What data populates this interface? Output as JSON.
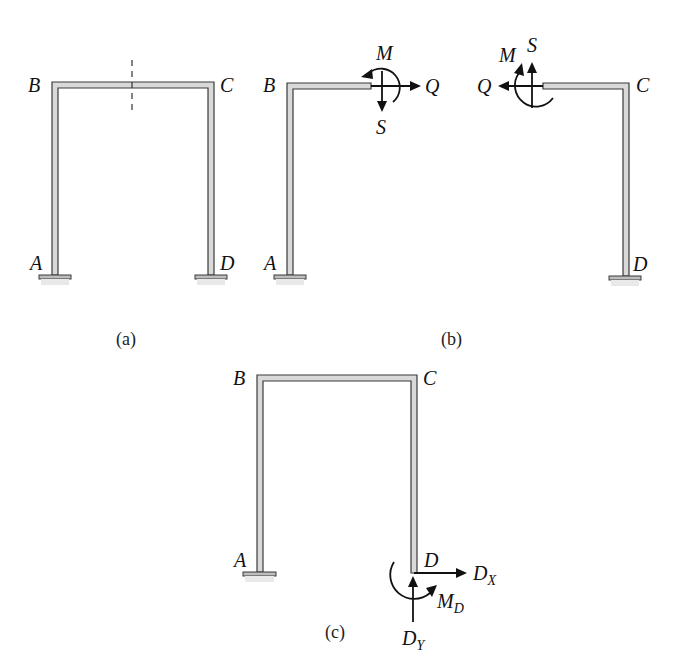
{
  "figure": {
    "panels": [
      {
        "id": "a",
        "caption": "(a)",
        "description": "Portal frame ABCD with fixed supports at A and D and a dashed section cut through beam BC",
        "labels": {
          "A": "A",
          "B": "B",
          "C": "C",
          "D": "D"
        }
      },
      {
        "id": "b",
        "caption": "(b)",
        "description": "Frame cut at section showing internal forces on each free body",
        "left_part": {
          "labels": {
            "A": "A",
            "B": "B"
          },
          "forces": {
            "moment": "M",
            "axial": "Q",
            "shear": "S"
          }
        },
        "right_part": {
          "labels": {
            "C": "C",
            "D": "D"
          },
          "forces": {
            "moment": "M",
            "axial": "Q",
            "shear": "S"
          }
        }
      },
      {
        "id": "c",
        "caption": "(c)",
        "description": "Frame with support D replaced by reactions",
        "labels": {
          "A": "A",
          "B": "B",
          "C": "C",
          "D": "D"
        },
        "reactions": {
          "horizontal": {
            "main": "D",
            "sub": "X"
          },
          "vertical": {
            "main": "D",
            "sub": "Y"
          },
          "moment": {
            "main": "M",
            "sub": "D"
          }
        }
      }
    ]
  },
  "colors": {
    "member_fill": "#d9d9d9",
    "outline": "#3a3a3a",
    "arrow": "#111111",
    "background": "#ffffff"
  }
}
